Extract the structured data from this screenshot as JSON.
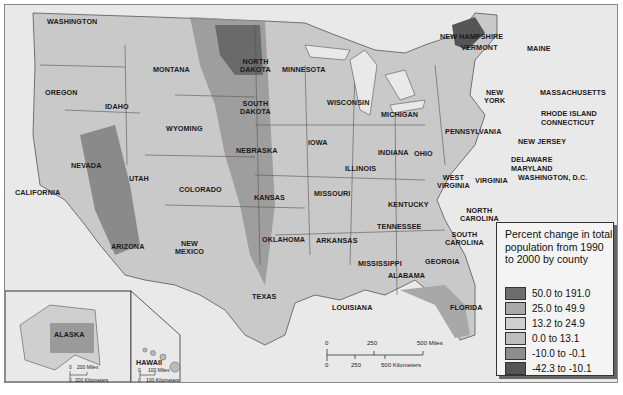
{
  "map": {
    "title": "Percent change in total population from 1990 to 2000 by county",
    "background_color": "#e9e9e9",
    "water_color": "#e9e9e9",
    "border_color": "#555555"
  },
  "legend": {
    "title": "Percent change in total population from 1990 to 2000 by county",
    "items": [
      {
        "label": "50.0 to 191.0",
        "color": "#6e6e6e"
      },
      {
        "label": "25.0 to 49.9",
        "color": "#a9a9a9"
      },
      {
        "label": "13.2 to 24.9",
        "color": "#cfcfcf"
      },
      {
        "label": "0.0 to 13.1",
        "color": "#bdbdbd"
      },
      {
        "label": "-10.0 to -0.1",
        "color": "#8d8d8d"
      },
      {
        "label": "-42.3 to -10.1",
        "color": "#555555"
      }
    ]
  },
  "states": {
    "washington": "WASHINGTON",
    "oregon": "OREGON",
    "california": "CALIFORNIA",
    "idaho": "IDAHO",
    "nevada": "NEVADA",
    "montana": "MONTANA",
    "wyoming": "WYOMING",
    "utah": "UTAH",
    "arizona": "ARIZONA",
    "colorado": "COLORADO",
    "new_mexico_1": "NEW",
    "new_mexico_2": "MEXICO",
    "north_dakota_1": "NORTH",
    "north_dakota_2": "DAKOTA",
    "south_dakota_1": "SOUTH",
    "south_dakota_2": "DAKOTA",
    "nebraska": "NEBRASKA",
    "kansas": "KANSAS",
    "oklahoma": "OKLAHOMA",
    "texas": "TEXAS",
    "minnesota": "MINNESOTA",
    "iowa": "IOWA",
    "missouri": "MISSOURI",
    "arkansas": "ARKANSAS",
    "louisiana": "LOUISIANA",
    "wisconsin": "WISCONSIN",
    "illinois": "ILLINOIS",
    "michigan": "MICHIGAN",
    "indiana": "INDIANA",
    "ohio": "OHIO",
    "kentucky": "KENTUCKY",
    "tennessee": "TENNESSEE",
    "mississippi": "MISSISSIPPI",
    "alabama": "ALABAMA",
    "georgia": "GEORGIA",
    "florida": "FLORIDA",
    "south_carolina_1": "SOUTH",
    "south_carolina_2": "CAROLINA",
    "north_carolina_1": "NORTH",
    "north_carolina_2": "CAROLINA",
    "virginia": "VIRGINIA",
    "west_virginia_1": "WEST",
    "west_virginia_2": "VIRGINIA",
    "pennsylvania": "PENNSYLVANIA",
    "new_york_1": "NEW",
    "new_york_2": "YORK",
    "maine": "MAINE",
    "new_hampshire": "NEW HAMPSHIRE",
    "vermont": "VERMONT",
    "massachusetts": "MASSACHUSETTS",
    "rhode_island": "RHODE ISLAND",
    "connecticut": "CONNECTICUT",
    "new_jersey": "NEW JERSEY",
    "delaware": "DELAWARE",
    "maryland": "MARYLAND",
    "washington_dc": "WASHINGTON, D.C.",
    "alaska": "ALASKA",
    "hawaii": "HAWAII"
  },
  "scale_bar": {
    "miles_ticks": [
      "0",
      "250",
      "500 Miles"
    ],
    "km_ticks": [
      "0",
      "250",
      "500 Kilometers"
    ]
  },
  "alaska_scale": {
    "miles": [
      "0",
      "200 Miles"
    ],
    "km": [
      "0",
      "200 Kilometers"
    ]
  },
  "hawaii_scale": {
    "miles": [
      "0",
      "100 Miles"
    ],
    "km": [
      "0",
      "100 Kilometers"
    ]
  }
}
